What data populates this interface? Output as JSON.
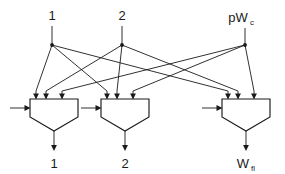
{
  "diagram": {
    "type": "logic-schematic",
    "line_color": "#1a1a1a",
    "background_color": "#ffffff",
    "sources": [
      {
        "id": "src1",
        "label": "1",
        "subscript": "",
        "x": 52,
        "label_x": 52,
        "label_y": 18,
        "node_x": 52,
        "node_y": 45
      },
      {
        "id": "src2",
        "label": "2",
        "subscript": "",
        "x": 122,
        "label_x": 122,
        "label_y": 18,
        "node_x": 122,
        "node_y": 45
      },
      {
        "id": "src3",
        "label": "pW",
        "subscript": "c",
        "x": 245,
        "label_x": 245,
        "label_y": 20,
        "node_x": 245,
        "node_y": 45
      }
    ],
    "muxes": [
      {
        "id": "mux1",
        "left": 30,
        "right": 78,
        "top": 99,
        "shoulder": 117,
        "apex_y": 131,
        "enable_arrow_y": 108,
        "input_arrow_x": [
          36,
          46,
          62
        ],
        "output_label": "1",
        "output_subscript": "",
        "output_label_x": 54,
        "output_label_y": 166
      },
      {
        "id": "mux2",
        "left": 101,
        "right": 149,
        "top": 99,
        "shoulder": 117,
        "apex_y": 131,
        "enable_arrow_y": 108,
        "input_arrow_x": [
          107,
          117,
          133
        ],
        "output_label": "2",
        "output_subscript": "",
        "output_label_x": 125,
        "output_label_y": 166
      },
      {
        "id": "mux3",
        "left": 222,
        "right": 270,
        "top": 99,
        "shoulder": 117,
        "apex_y": 131,
        "enable_arrow_y": 108,
        "input_arrow_x": [
          228,
          238,
          254
        ],
        "output_label": "W",
        "output_subscript": "fl",
        "output_label_x": 246,
        "output_label_y": 166
      }
    ],
    "connections": [
      {
        "from": "src1",
        "to": "mux1",
        "port": 0
      },
      {
        "from": "src1",
        "to": "mux2",
        "port": 0
      },
      {
        "from": "src1",
        "to": "mux3",
        "port": 0
      },
      {
        "from": "src2",
        "to": "mux1",
        "port": 1
      },
      {
        "from": "src2",
        "to": "mux2",
        "port": 1
      },
      {
        "from": "src2",
        "to": "mux3",
        "port": 1
      },
      {
        "from": "src3",
        "to": "mux1",
        "port": 2
      },
      {
        "from": "src3",
        "to": "mux2",
        "port": 2
      },
      {
        "from": "src3",
        "to": "mux3",
        "port": 2
      }
    ],
    "enable_inputs": [
      {
        "mux": "mux1",
        "x_start": 10,
        "x_end": 30,
        "y": 108
      },
      {
        "mux": "mux2",
        "x_start": 81,
        "x_end": 101,
        "y": 108
      },
      {
        "mux": "mux3",
        "x_start": 202,
        "x_end": 222,
        "y": 108
      }
    ]
  }
}
